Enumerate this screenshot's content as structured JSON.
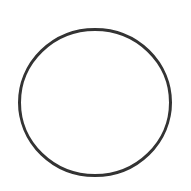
{
  "canvas": {
    "width": 191,
    "height": 191,
    "background": "#ffffff"
  },
  "shapes": [
    {
      "type": "circle-outline",
      "cx": 95,
      "cy": 102.5,
      "rx": 75.5,
      "ry": 73,
      "stroke": "#333333",
      "stroke_width": 3,
      "fill": "none"
    }
  ]
}
